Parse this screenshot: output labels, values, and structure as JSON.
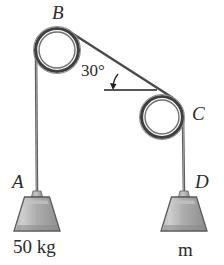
{
  "figure": {
    "background_color": "#ffffff",
    "stroke_color": "#3a3a3a",
    "weight_fill_color": "#a8a8a8",
    "rope_color": "#555555"
  },
  "labels": {
    "pulley_top": "B",
    "pulley_right": "C",
    "hanger_left": "A",
    "hanger_right": "D",
    "angle": "30°",
    "mass_left": "50 kg",
    "mass_right": "m"
  },
  "geometry": {
    "pulley_top": {
      "cx": 57,
      "cy": 50,
      "r_outer": 22,
      "r_inner": 17
    },
    "pulley_right": {
      "cx": 162,
      "cy": 117,
      "r_outer": 21,
      "r_inner": 16
    },
    "angle_degrees": 30,
    "rope_left_x": 36,
    "rope_right_x": 183,
    "weight_left": {
      "cx": 37,
      "top": 196,
      "bottom": 232
    },
    "weight_right": {
      "cx": 184,
      "top": 196,
      "bottom": 232
    }
  }
}
